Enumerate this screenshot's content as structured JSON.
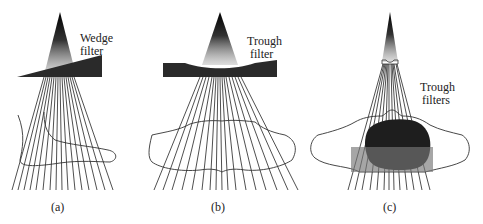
{
  "panels": [
    {
      "id": "a",
      "caption": "(a)",
      "label_line1": "Wedge",
      "label_line2": "filter"
    },
    {
      "id": "b",
      "caption": "(b)",
      "label_line1": "Trough",
      "label_line2": "filter"
    },
    {
      "id": "c",
      "caption": "(c)",
      "label_line1": "Trough",
      "label_line2": "filters"
    }
  ],
  "colors": {
    "beam": "#000000",
    "filter": "#2a2a2a",
    "tumor": "#1e1e1e",
    "box": "#777777",
    "outline": "#333333"
  }
}
